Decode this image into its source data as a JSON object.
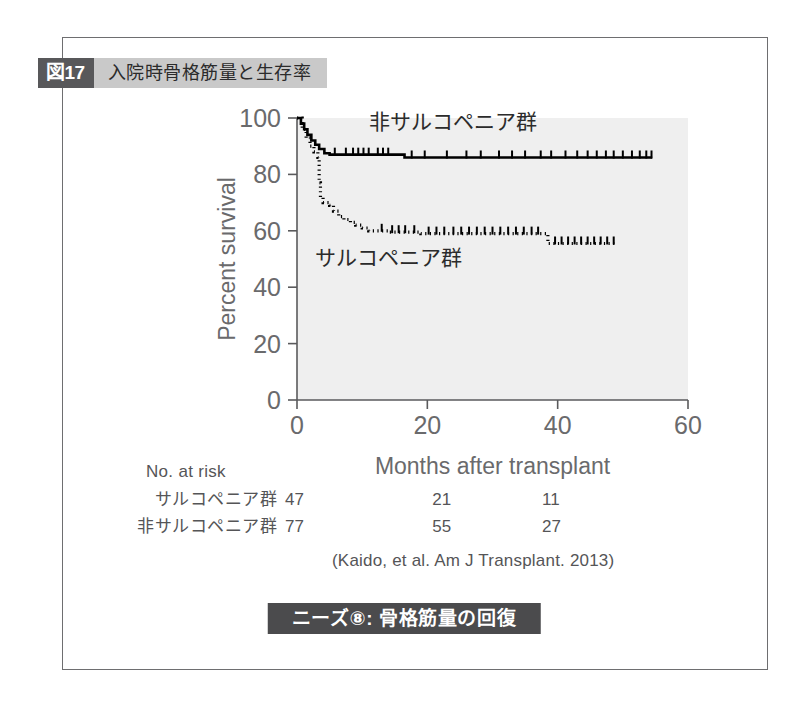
{
  "figure": {
    "number_label": "図17",
    "title": "入院時骨格筋量と生存率",
    "citation": "(Kaido, et al. Am J Transplant. 2013)",
    "banner": "ニーズ⑧: 骨格筋量の回復",
    "frame_color": "#6e6e70",
    "badge_bg": "#58585a",
    "title_band_bg": "#c9c9c9",
    "banner_bg": "#4b4b4d"
  },
  "risk_table": {
    "title": "No. at risk",
    "rows": [
      {
        "label": "サルコペニア群",
        "values": [
          "47",
          "21",
          "11"
        ]
      },
      {
        "label": "非サルコペニア群",
        "values": [
          "77",
          "55",
          "27"
        ]
      }
    ]
  },
  "chart_data": {
    "type": "line",
    "title": "入院時骨格筋量と生存率",
    "xlabel": "Months after transplant",
    "ylabel": "Percent survival",
    "xlim": [
      0,
      60
    ],
    "ylim": [
      0,
      100
    ],
    "xticks": [
      0,
      20,
      40,
      60
    ],
    "yticks": [
      0,
      20,
      40,
      60,
      80,
      100
    ],
    "grid": false,
    "legend_position": "inline-annotation",
    "plot_bg": "#efefef",
    "series": [
      {
        "name": "非サルコペニア群",
        "style": "solid",
        "color": "#000000",
        "label_x": 24,
        "label_y": 96,
        "points": [
          [
            0,
            100
          ],
          [
            0.6,
            98
          ],
          [
            1.1,
            96
          ],
          [
            1.6,
            94
          ],
          [
            2.2,
            92
          ],
          [
            2.8,
            90.5
          ],
          [
            3.4,
            89
          ],
          [
            4.2,
            87.5
          ],
          [
            5.0,
            87
          ],
          [
            16.0,
            87
          ],
          [
            16.5,
            86
          ],
          [
            54.5,
            86
          ]
        ],
        "censor_marks": [
          5.8,
          7.5,
          8.6,
          9.4,
          10.2,
          11.0,
          12.4,
          13.2,
          14.0,
          17.6,
          19.6,
          23.0,
          26.0,
          28.2,
          31.0,
          33.0,
          35.0,
          37.4,
          39.0,
          41.2,
          43.0,
          44.6,
          46.0,
          47.4,
          48.6,
          50.0,
          51.4,
          52.6,
          53.6,
          54.4
        ]
      },
      {
        "name": "サルコペニア群",
        "style": "dotted",
        "color": "#000000",
        "label_x": 14,
        "label_y": 48,
        "points": [
          [
            0,
            100
          ],
          [
            0.8,
            96
          ],
          [
            1.4,
            93
          ],
          [
            2.0,
            90
          ],
          [
            2.6,
            88
          ],
          [
            3.2,
            86
          ],
          [
            3.4,
            77
          ],
          [
            3.6,
            72
          ],
          [
            4.0,
            70
          ],
          [
            5.0,
            69
          ],
          [
            5.6,
            67
          ],
          [
            6.4,
            65
          ],
          [
            7.2,
            64
          ],
          [
            8.2,
            63
          ],
          [
            9.0,
            62
          ],
          [
            10.0,
            61
          ],
          [
            11.0,
            60
          ],
          [
            12.5,
            60
          ],
          [
            14.0,
            59.5
          ],
          [
            17.0,
            59.5
          ],
          [
            19.0,
            59
          ],
          [
            37.5,
            59
          ],
          [
            38.5,
            55.5
          ],
          [
            49.0,
            55
          ]
        ],
        "censor_marks": [
          13.0,
          14.6,
          15.6,
          16.6,
          18.0,
          20.2,
          21.4,
          22.6,
          24.0,
          25.2,
          26.4,
          27.6,
          28.8,
          30.0,
          31.2,
          32.4,
          33.6,
          34.8,
          36.0,
          37.0,
          39.6,
          40.6,
          41.6,
          42.6,
          43.6,
          44.6,
          45.6,
          46.6,
          47.6,
          48.6
        ]
      }
    ]
  }
}
